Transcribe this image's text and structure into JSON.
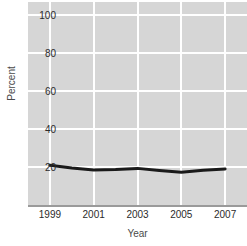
{
  "chart_data": {
    "type": "line",
    "title": "",
    "xlabel": "Year",
    "ylabel": "Percent",
    "x": [
      1999,
      2000,
      2001,
      2002,
      2003,
      2004,
      2005,
      2006,
      2007
    ],
    "values": [
      21,
      19.5,
      18.5,
      18.7,
      19.3,
      18.2,
      17.3,
      18.3,
      19
    ],
    "series": [
      {
        "name": "Percent",
        "values": [
          21,
          19.5,
          18.5,
          18.7,
          19.3,
          18.2,
          17.3,
          18.3,
          19
        ]
      }
    ],
    "xlim": [
      1998,
      2008
    ],
    "ylim": [
      0,
      107
    ],
    "xticks": [
      1999,
      2001,
      2003,
      2005,
      2007
    ],
    "xtick_labels": [
      "1999",
      "2001",
      "2003",
      "2005",
      "2007"
    ],
    "yticks": [
      20,
      40,
      60,
      80,
      100
    ],
    "ytick_labels": [
      "20",
      "40",
      "60",
      "80",
      "100"
    ],
    "grid": true,
    "grid_color": "#ffffff",
    "plot_background": "#d6d6d6",
    "line_color": "#1a1a1a",
    "line_width": 3,
    "legend": "none"
  }
}
